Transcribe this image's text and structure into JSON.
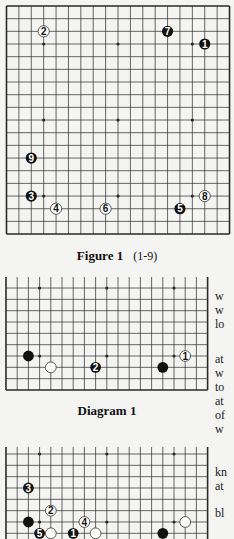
{
  "colors": {
    "background": "#f4f4f2",
    "grid": "#2a2a2a",
    "black_stone": "#111111",
    "white_stone": "#ffffff",
    "stone_outline": "#333333"
  },
  "figure1": {
    "caption": "Figure 1",
    "range": "(1-9)",
    "board": {
      "size": 19,
      "visible_rows": [
        0,
        18
      ],
      "borders": [
        "top",
        "bottom",
        "left",
        "right"
      ]
    },
    "stones": [
      {
        "n": "1",
        "color": "black",
        "col": 16,
        "row": 3
      },
      {
        "n": "2",
        "color": "white",
        "col": 3,
        "row": 2
      },
      {
        "n": "3",
        "color": "black",
        "col": 2,
        "row": 15
      },
      {
        "n": "4",
        "color": "white",
        "col": 4,
        "row": 16
      },
      {
        "n": "5",
        "color": "black",
        "col": 14,
        "row": 16
      },
      {
        "n": "6",
        "color": "white",
        "col": 8,
        "row": 16
      },
      {
        "n": "7",
        "color": "black",
        "col": 13,
        "row": 2
      },
      {
        "n": "8",
        "color": "white",
        "col": 16,
        "row": 15
      },
      {
        "n": "9",
        "color": "black",
        "col": 2,
        "row": 12
      }
    ]
  },
  "diagram1": {
    "caption": "Diagram 1",
    "board": {
      "size": 19,
      "visible_rows": [
        8,
        18
      ],
      "borders": [
        "bottom",
        "left",
        "right"
      ]
    },
    "stones": [
      {
        "n": "",
        "color": "black",
        "col": 2,
        "row": 15
      },
      {
        "n": "",
        "color": "white",
        "col": 4,
        "row": 16
      },
      {
        "n": "2",
        "color": "black",
        "col": 8,
        "row": 16
      },
      {
        "n": "",
        "color": "black",
        "col": 14,
        "row": 16
      },
      {
        "n": "1",
        "color": "white",
        "col": 16,
        "row": 15
      }
    ]
  },
  "diagram2": {
    "board": {
      "size": 19,
      "visible_rows": [
        8,
        17
      ],
      "borders": [
        "left",
        "right"
      ]
    },
    "stones": [
      {
        "n": "1",
        "color": "black",
        "col": 6,
        "row": 16
      },
      {
        "n": "2",
        "color": "white",
        "col": 4,
        "row": 14
      },
      {
        "n": "3",
        "color": "black",
        "col": 2,
        "row": 12
      },
      {
        "n": "4",
        "color": "white",
        "col": 7,
        "row": 15
      },
      {
        "n": "5",
        "color": "black",
        "col": 3,
        "row": 16
      },
      {
        "n": "",
        "color": "black",
        "col": 2,
        "row": 15
      },
      {
        "n": "",
        "color": "white",
        "col": 4,
        "row": 16
      },
      {
        "n": "",
        "color": "white",
        "col": 8,
        "row": 16
      },
      {
        "n": "",
        "color": "black",
        "col": 14,
        "row": 16
      },
      {
        "n": "",
        "color": "white",
        "col": 16,
        "row": 15
      }
    ]
  },
  "side_text": {
    "block1": [
      "w",
      "w",
      "lo"
    ],
    "block2": [
      "at",
      "w",
      "to",
      "at",
      "of",
      "w"
    ],
    "block3": [
      "kn",
      "at"
    ],
    "block4": [
      "bl"
    ]
  }
}
